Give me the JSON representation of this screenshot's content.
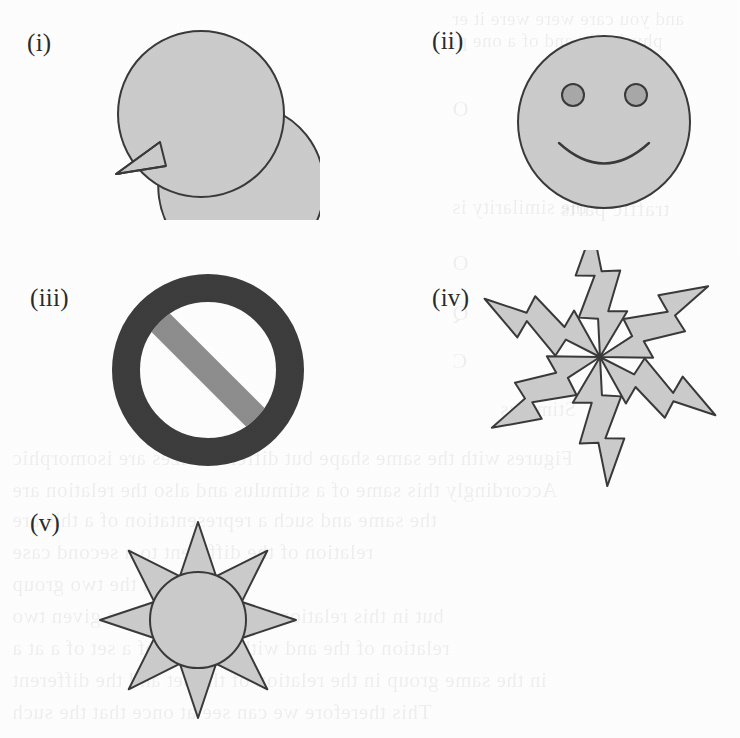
{
  "page": {
    "width": 740,
    "height": 738,
    "background_color": "#fdfdfd",
    "kind": "scanned-book-figure-page"
  },
  "palette": {
    "shape_fill": "#cbcbcb",
    "shape_stroke": "#3a3a3a",
    "dark_ring": "#3d3d3d",
    "band_gray": "#8d8d8d",
    "eye_fill": "#a8a8a8",
    "label_color": "#2b2b2b",
    "paper": "#fdfdfd"
  },
  "figures": [
    {
      "id": "i",
      "label": "(i)",
      "name": "speech-bubble",
      "description": "Filled circle with a pointed tail at the lower left, a speech balloon.",
      "label_x": 27,
      "label_y": 30,
      "center": [
        201,
        114
      ],
      "radius": 83
    },
    {
      "id": "ii",
      "label": "(ii)",
      "name": "smiley-face",
      "description": "Filled circle with two darker round eyes and an upward smile arc.",
      "label_x": 432,
      "label_y": 28,
      "center": [
        604,
        122
      ],
      "radius": 86,
      "eyes": [
        {
          "cx": 573,
          "cy": 95,
          "r": 11
        },
        {
          "cx": 636,
          "cy": 95,
          "r": 11
        }
      ],
      "mouth": {
        "cx": 604,
        "cy": 140,
        "rx": 50,
        "ry": 30
      }
    },
    {
      "id": "iii",
      "label": "(iii)",
      "name": "prohibition-sign",
      "description": "Thick dark annulus crossed by a medium-gray diagonal band running from upper left to lower right.",
      "label_x": 30,
      "label_y": 285,
      "center": [
        208,
        370
      ],
      "outer_radius": 96,
      "inner_radius": 68,
      "band_angle_deg": 45,
      "band_width": 26
    },
    {
      "id": "iv",
      "label": "(iv)",
      "name": "lightning-burst",
      "description": "Six identical zig-zag lightning-bolt polygons radiating from a common center, each rotated 60 degrees.",
      "label_x": 432,
      "label_y": 285,
      "center": [
        600,
        357
      ],
      "bolt_count": 6,
      "rotation_step_deg": 60,
      "start_angle_deg": -78
    },
    {
      "id": "v",
      "label": "(v)",
      "name": "sun",
      "description": "Filled circle surrounded by eight outward-pointing triangular rays.",
      "label_x": 30,
      "label_y": 510,
      "center": [
        198,
        620
      ],
      "radius": 48,
      "ray_count": 8,
      "ray_inner_radius": 57,
      "ray_outer_radius": 98
    }
  ],
  "ghost_text": [
    {
      "text": "and you care were  were  it er",
      "x": 452,
      "y": 8,
      "size": 19
    },
    {
      "text": "physically and of   a   one pa",
      "x": 448,
      "y": 30,
      "size": 19
    },
    {
      "text": "O",
      "x": 452,
      "y": 96,
      "size": 22
    },
    {
      "text": "the  similarity   is",
      "x": 452,
      "y": 196,
      "size": 20
    },
    {
      "text": "traffic  parts",
      "x": 560,
      "y": 196,
      "size": 22
    },
    {
      "text": "O",
      "x": 452,
      "y": 250,
      "size": 22
    },
    {
      "text": "Q",
      "x": 452,
      "y": 300,
      "size": 22
    },
    {
      "text": "C",
      "x": 452,
      "y": 348,
      "size": 22
    },
    {
      "text": "Stimulus",
      "x": 500,
      "y": 398,
      "size": 20
    },
    {
      "text": "Figures  with  the  same   shape  but different  sizes are isomorphic",
      "x": 12,
      "y": 446,
      "size": 21
    },
    {
      "text": "Accordingly  this  same   of  a  stimulus  and  also  the  relation  are",
      "x": 12,
      "y": 478,
      "size": 21
    },
    {
      "text": "the  same  and   such  a  representation   of  a   this  are",
      "x": 12,
      "y": 508,
      "size": 21
    },
    {
      "text": "relation  of  the   different   to  a   second   case",
      "x": 12,
      "y": 540,
      "size": 21
    },
    {
      "text": "between  the  two   group",
      "x": 12,
      "y": 572,
      "size": 21
    },
    {
      "text": "but  in  this  relation        In  the  relation  to  a  given  two",
      "x": 12,
      "y": 604,
      "size": 21
    },
    {
      "text": "relation  of  the   and   with  the  case   of  a  set  of  a   at  a",
      "x": 12,
      "y": 636,
      "size": 21
    },
    {
      "text": "in  the  same  group   in  the  relation   of  the  set  and   the  different",
      "x": 12,
      "y": 668,
      "size": 21
    },
    {
      "text": "This   therefore   we   can   see   at   once   that   the   such",
      "x": 12,
      "y": 700,
      "size": 21
    }
  ]
}
